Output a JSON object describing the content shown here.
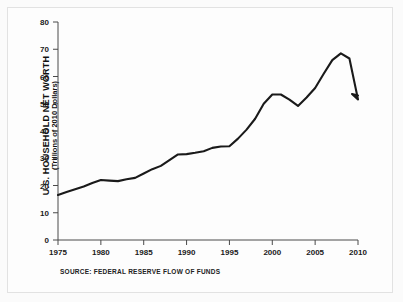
{
  "figure": {
    "y_axis_title": "U.S. HOUSEHOLD NET WORTH",
    "y_axis_subtitle": "(Trillions of 2010 Dollars)",
    "source_note": "SOURCE: FEDERAL RESERVE FLOW OF FUNDS",
    "line_color": "#1a1a1a",
    "axis_color": "#4a4a4a",
    "background_color": "#fdfdfd",
    "frame_color": "#e2e2e2"
  },
  "chart_data": {
    "type": "line",
    "title": "",
    "subtitle": "",
    "xlabel": "",
    "ylabel": "U.S. HOUSEHOLD NET WORTH (Trillions of 2010 Dollars)",
    "xlim": [
      1975,
      2010
    ],
    "ylim": [
      0,
      80
    ],
    "xticks": [
      1975,
      1980,
      1985,
      1990,
      1995,
      2000,
      2005,
      2010
    ],
    "yticks": [
      0,
      10,
      20,
      30,
      40,
      50,
      60,
      70,
      80
    ],
    "grid": false,
    "legend": null,
    "annotations": [
      "SOURCE: FEDERAL RESERVE FLOW OF FUNDS"
    ],
    "series": [
      {
        "name": "U.S. Household Net Worth",
        "x": [
          1975,
          1976,
          1977,
          1978,
          1979,
          1980,
          1981,
          1982,
          1983,
          1984,
          1985,
          1986,
          1987,
          1988,
          1989,
          1990,
          1991,
          1992,
          1993,
          1994,
          1995,
          1996,
          1997,
          1998,
          1999,
          2000,
          2001,
          2002,
          2003,
          2004,
          2005,
          2006,
          2007,
          2008,
          2009,
          2010
        ],
        "values": [
          16.5,
          17.6,
          18.6,
          19.6,
          20.9,
          22.0,
          21.8,
          21.6,
          22.3,
          22.8,
          24.4,
          26.0,
          27.2,
          29.3,
          31.4,
          31.5,
          32.0,
          32.6,
          33.8,
          34.3,
          34.4,
          37.2,
          40.5,
          44.5,
          50.0,
          53.4,
          53.4,
          51.5,
          49.2,
          52.3,
          55.8,
          61.0,
          66.0,
          68.5,
          66.6,
          51.6
        ],
        "note": "approximate readings from plotted curve"
      }
    ],
    "data_points_pixel_reading": {
      "start_1975": 16.5,
      "local_peak_1980": 22.0,
      "dip_1982": 21.6,
      "plateau_1989_1990": 31.5,
      "plateau_1993_1994": 34.3,
      "plateau_1999_2000": 53.4,
      "trough_2002": 49.2,
      "peak_2006_2007": 68.5,
      "crash_low_2008": 51.6,
      "end_2010": 53.0
    }
  },
  "ticks": {
    "x_labels": [
      "1975",
      "1980",
      "1985",
      "1990",
      "1995",
      "2000",
      "2005",
      "2010"
    ],
    "y_labels": [
      "0",
      "10",
      "20",
      "30",
      "40",
      "50",
      "60",
      "70",
      "80"
    ]
  }
}
